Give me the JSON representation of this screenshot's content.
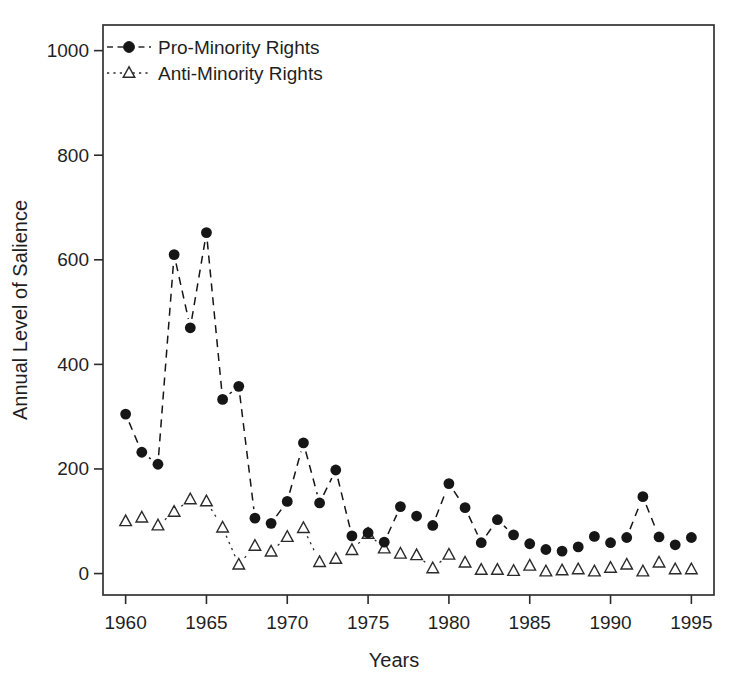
{
  "figure": {
    "background": "#ffffff",
    "text_color": "#1f1f1f",
    "line_color": "#2b2b2b",
    "marker_fill": "#161616"
  },
  "chart_data": {
    "type": "line",
    "title": "",
    "xlabel": "Years",
    "ylabel": "Annual Level of Salience",
    "x": [
      1960,
      1961,
      1962,
      1963,
      1964,
      1965,
      1966,
      1967,
      1968,
      1969,
      1970,
      1971,
      1972,
      1973,
      1974,
      1975,
      1976,
      1977,
      1978,
      1979,
      1980,
      1981,
      1982,
      1983,
      1984,
      1985,
      1986,
      1987,
      1988,
      1989,
      1990,
      1991,
      1992,
      1993,
      1994,
      1995
    ],
    "series": [
      {
        "name": "Pro-Minority Rights",
        "marker": "filled-circle",
        "line_style": "dashed",
        "color": "#161616",
        "values": [
          305,
          232,
          209,
          610,
          470,
          652,
          333,
          358,
          106,
          96,
          138,
          250,
          135,
          198,
          72,
          78,
          60,
          128,
          110,
          92,
          172,
          126,
          59,
          103,
          74,
          57,
          46,
          43,
          51,
          71,
          59,
          69,
          147,
          70,
          55,
          69
        ]
      },
      {
        "name": "Anti-Minority Rights",
        "marker": "open-triangle",
        "line_style": "dotted",
        "color": "#2b2b2b",
        "values": [
          100,
          107,
          92,
          118,
          142,
          138,
          88,
          17,
          53,
          42,
          70,
          87,
          22,
          28,
          45,
          76,
          48,
          38,
          35,
          10,
          36,
          21,
          7,
          7,
          5,
          15,
          4,
          6,
          8,
          4,
          11,
          17,
          4,
          21,
          8,
          8
        ]
      }
    ],
    "xticks": [
      1960,
      1965,
      1970,
      1975,
      1980,
      1985,
      1990,
      1995
    ],
    "yticks": [
      0,
      200,
      400,
      600,
      800,
      1000
    ],
    "xlim": [
      1958.6,
      1996.4
    ],
    "ylim": [
      -41,
      1049
    ],
    "grid": false,
    "legend_position": "top-left"
  }
}
